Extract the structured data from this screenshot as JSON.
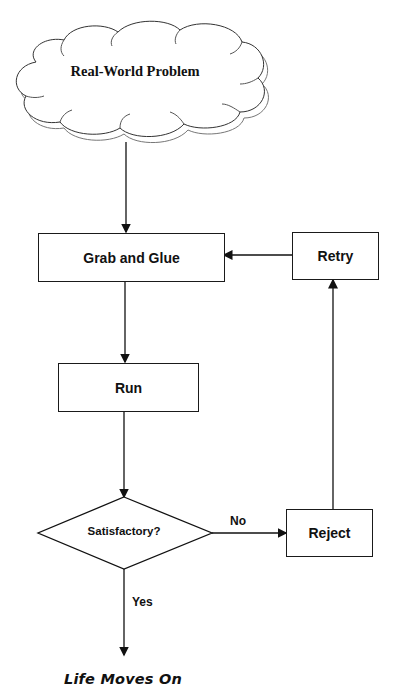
{
  "diagram": {
    "type": "flowchart",
    "nodes": {
      "problem": {
        "label": "Real-World Problem",
        "shape": "cloud"
      },
      "grab_glue": {
        "label": "Grab and Glue",
        "shape": "rectangle"
      },
      "retry": {
        "label": "Retry",
        "shape": "rectangle"
      },
      "run": {
        "label": "Run",
        "shape": "rectangle"
      },
      "decision": {
        "label": "Satisfactory?",
        "shape": "diamond"
      },
      "reject": {
        "label": "Reject",
        "shape": "rectangle"
      },
      "end": {
        "label": "Life Moves On",
        "shape": "text"
      }
    },
    "edges": {
      "no_label": "No",
      "yes_label": "Yes"
    },
    "connections": [
      {
        "from": "Real-World Problem",
        "to": "Grab and Glue"
      },
      {
        "from": "Grab and Glue",
        "to": "Run"
      },
      {
        "from": "Run",
        "to": "Satisfactory?"
      },
      {
        "from": "Satisfactory?",
        "to": "Reject",
        "label": "No"
      },
      {
        "from": "Reject",
        "to": "Retry"
      },
      {
        "from": "Retry",
        "to": "Grab and Glue"
      },
      {
        "from": "Satisfactory?",
        "to": "Life Moves On",
        "label": "Yes"
      }
    ],
    "colors": {
      "line": "#1a1a1a",
      "background": "#ffffff"
    }
  }
}
